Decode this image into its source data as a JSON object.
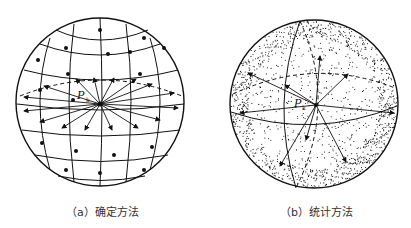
{
  "figure": {
    "panels": [
      {
        "id": "a",
        "caption": "（a）确定方法",
        "point_label": "P",
        "point_subscript": "k",
        "style": "deterministic",
        "center": [
          100,
          104
        ],
        "radius": 85
      },
      {
        "id": "b",
        "caption": "（b）统计方法",
        "point_label": "P",
        "point_subscript": "k",
        "style": "statistical",
        "center": [
          314,
          104
        ],
        "radius": 84
      }
    ]
  },
  "colors": {
    "stroke": "#111111",
    "background": "#ffffff",
    "caption": "#333333"
  }
}
